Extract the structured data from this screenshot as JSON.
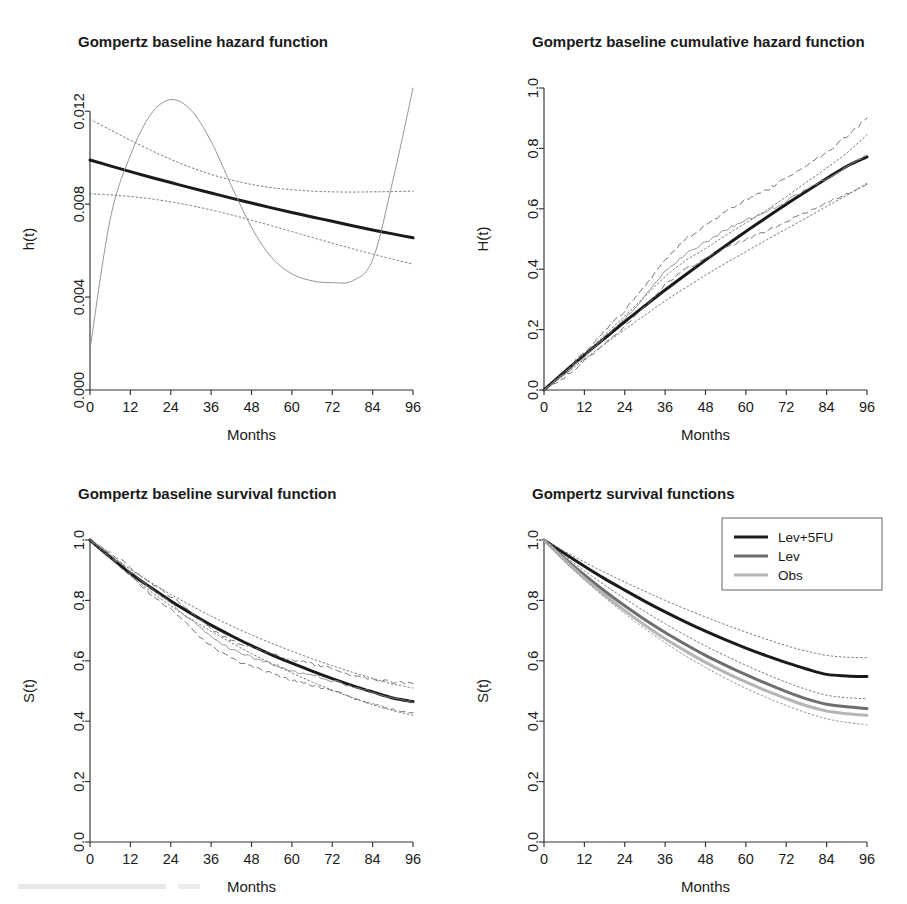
{
  "figure": {
    "width": 907,
    "height": 904,
    "background": "#ffffff",
    "layout": "2x2 grid of R base-graphics panels"
  },
  "style": {
    "fitted_color": "#1a1a1a",
    "lev_color": "#6e6e6e",
    "obs_color": "#b5b5b5",
    "nonparametric_color": "#8a8a8a",
    "ci_color": "#707070",
    "axis_color": "#333333"
  },
  "panels": [
    {
      "id": "hazard",
      "title": "Gompertz baseline  hazard function",
      "xlabel": "Months",
      "ylabel": "h(t)"
    },
    {
      "id": "cumhazard",
      "title": "Gompertz baseline cumulative hazard function",
      "xlabel": "Months",
      "ylabel": "H(t)"
    },
    {
      "id": "survival",
      "title": "Gompertz baseline survival function",
      "xlabel": "Months",
      "ylabel": "S(t)"
    },
    {
      "id": "survgroups",
      "title": "Gompertz survival functions",
      "xlabel": "Months",
      "ylabel": "S(t)"
    }
  ],
  "chart_data": [
    {
      "id": "hazard",
      "type": "line",
      "title": "Gompertz baseline  hazard function",
      "xlabel": "Months",
      "ylabel": "h(t)",
      "xlim": [
        0,
        96
      ],
      "ylim": [
        0,
        0.013
      ],
      "xticks": [
        0,
        12,
        24,
        36,
        48,
        60,
        72,
        84,
        96
      ],
      "yticks": [
        0.0,
        0.004,
        0.008,
        0.012
      ],
      "ytick_labels": [
        "0.000",
        "0.004",
        "0.008",
        "0.012"
      ],
      "grid": false,
      "legend": null,
      "x": [
        0,
        6,
        12,
        18,
        24,
        30,
        36,
        42,
        48,
        54,
        60,
        66,
        72,
        78,
        84,
        90,
        96
      ],
      "series": [
        {
          "name": "Gompertz fitted baseline hazard",
          "style": "solid-thick",
          "color": "#1a1a1a",
          "values": [
            0.0099,
            0.00965,
            0.0094,
            0.00916,
            0.00893,
            0.0087,
            0.00848,
            0.00826,
            0.00805,
            0.00784,
            0.00764,
            0.00745,
            0.00726,
            0.00707,
            0.00689,
            0.00672,
            0.00655
          ]
        },
        {
          "name": "Upper 95% confidence band",
          "style": "dotted",
          "color": "#707070",
          "values": [
            0.01165,
            0.0112,
            0.01075,
            0.01032,
            0.00993,
            0.00958,
            0.00928,
            0.00904,
            0.00885,
            0.00871,
            0.00862,
            0.00856,
            0.00853,
            0.00852,
            0.00853,
            0.00854,
            0.00856
          ]
        },
        {
          "name": "Lower 95% confidence band",
          "style": "dotted",
          "color": "#707070",
          "values": [
            0.00845,
            0.0084,
            0.00833,
            0.00823,
            0.0081,
            0.00794,
            0.00775,
            0.00754,
            0.00731,
            0.00707,
            0.00682,
            0.00657,
            0.00632,
            0.00608,
            0.00585,
            0.00563,
            0.00542
          ]
        },
        {
          "name": "Smoothed non-parametric hazard",
          "style": "solid-thin",
          "color": "#8a8a8a",
          "values": [
            0.00175,
            0.00735,
            0.0101,
            0.01185,
            0.0125,
            0.01205,
            0.0107,
            0.0088,
            0.007,
            0.0057,
            0.005,
            0.0047,
            0.00462,
            0.0047,
            0.0056,
            0.009,
            0.013
          ]
        }
      ]
    },
    {
      "id": "cumhazard",
      "type": "line",
      "title": "Gompertz baseline cumulative hazard function",
      "xlabel": "Months",
      "ylabel": "H(t)",
      "xlim": [
        0,
        96
      ],
      "ylim": [
        0,
        1.0
      ],
      "xticks": [
        0,
        12,
        24,
        36,
        48,
        60,
        72,
        84,
        96
      ],
      "yticks": [
        0.0,
        0.2,
        0.4,
        0.6,
        0.8,
        1.0
      ],
      "ytick_labels": [
        "0.0",
        "0.2",
        "0.4",
        "0.6",
        "0.8",
        "1.0"
      ],
      "grid": false,
      "legend": null,
      "x": [
        0,
        6,
        12,
        18,
        24,
        30,
        36,
        42,
        48,
        54,
        60,
        66,
        72,
        78,
        84,
        90,
        96
      ],
      "series": [
        {
          "name": "Gompertz fitted cumulative hazard",
          "style": "solid-thick",
          "color": "#1a1a1a",
          "values": [
            0.0,
            0.059,
            0.116,
            0.171,
            0.226,
            0.279,
            0.331,
            0.381,
            0.43,
            0.478,
            0.525,
            0.57,
            0.615,
            0.658,
            0.7,
            0.741,
            0.772
          ]
        },
        {
          "name": "Nelson-Aalen estimate",
          "style": "solid-thin",
          "color": "#8a8a8a",
          "values": [
            0.0,
            0.05,
            0.11,
            0.175,
            0.235,
            0.31,
            0.39,
            0.45,
            0.49,
            0.53,
            0.565,
            0.59,
            0.625,
            0.665,
            0.7,
            0.74,
            0.775
          ]
        },
        {
          "name": "Upper 95% band (Nelson-Aalen)",
          "style": "dashed",
          "color": "#707070",
          "values": [
            0.0,
            0.058,
            0.125,
            0.196,
            0.262,
            0.345,
            0.432,
            0.5,
            0.545,
            0.59,
            0.63,
            0.66,
            0.7,
            0.745,
            0.788,
            0.84,
            0.9
          ]
        },
        {
          "name": "Lower 95% band (Nelson-Aalen)",
          "style": "dashed",
          "color": "#707070",
          "values": [
            0.0,
            0.042,
            0.096,
            0.154,
            0.208,
            0.275,
            0.348,
            0.4,
            0.435,
            0.47,
            0.5,
            0.525,
            0.555,
            0.59,
            0.62,
            0.65,
            0.682
          ]
        },
        {
          "name": "Upper 95% band (model)",
          "style": "dotted",
          "color": "#707070",
          "values": [
            0.0,
            0.058,
            0.12,
            0.182,
            0.245,
            0.31,
            0.375,
            0.428,
            0.468,
            0.512,
            0.553,
            0.595,
            0.64,
            0.688,
            0.735,
            0.785,
            0.845
          ]
        },
        {
          "name": "Lower 95% band (model)",
          "style": "dotted",
          "color": "#707070",
          "values": [
            0.0,
            0.05,
            0.102,
            0.152,
            0.2,
            0.248,
            0.295,
            0.338,
            0.38,
            0.42,
            0.458,
            0.496,
            0.533,
            0.57,
            0.608,
            0.645,
            0.685
          ]
        }
      ]
    },
    {
      "id": "survival",
      "type": "line",
      "title": "Gompertz baseline survival function",
      "xlabel": "Months",
      "ylabel": "S(t)",
      "xlim": [
        0,
        96
      ],
      "ylim": [
        0,
        1.0
      ],
      "xticks": [
        0,
        12,
        24,
        36,
        48,
        60,
        72,
        84,
        96
      ],
      "yticks": [
        0.0,
        0.2,
        0.4,
        0.6,
        0.8,
        1.0
      ],
      "ytick_labels": [
        "0.0",
        "0.2",
        "0.4",
        "0.6",
        "0.8",
        "1.0"
      ],
      "grid": false,
      "legend": null,
      "x": [
        0,
        6,
        12,
        18,
        24,
        30,
        36,
        42,
        48,
        54,
        60,
        66,
        72,
        78,
        84,
        90,
        96
      ],
      "series": [
        {
          "name": "Gompertz fitted baseline survival",
          "style": "solid-thick",
          "color": "#1a1a1a",
          "values": [
            1.0,
            0.943,
            0.89,
            0.843,
            0.798,
            0.757,
            0.718,
            0.683,
            0.65,
            0.62,
            0.592,
            0.566,
            0.541,
            0.518,
            0.497,
            0.477,
            0.465
          ]
        },
        {
          "name": "Kaplan-Meier estimate",
          "style": "solid-thin",
          "color": "#8a8a8a",
          "values": [
            1.0,
            0.951,
            0.896,
            0.84,
            0.791,
            0.734,
            0.677,
            0.638,
            0.613,
            0.589,
            0.568,
            0.554,
            0.535,
            0.514,
            0.497,
            0.477,
            0.461
          ]
        },
        {
          "name": "Upper 95% band (KM)",
          "style": "dashed",
          "color": "#707070",
          "values": [
            1.0,
            0.958,
            0.909,
            0.858,
            0.813,
            0.761,
            0.706,
            0.668,
            0.645,
            0.622,
            0.602,
            0.59,
            0.573,
            0.553,
            0.54,
            0.53,
            0.525
          ]
        },
        {
          "name": "Lower 95% band (KM)",
          "style": "dashed",
          "color": "#707070",
          "values": [
            1.0,
            0.944,
            0.883,
            0.822,
            0.769,
            0.708,
            0.648,
            0.608,
            0.582,
            0.558,
            0.535,
            0.52,
            0.5,
            0.478,
            0.458,
            0.44,
            0.428
          ]
        },
        {
          "name": "Upper 95% band (model)",
          "style": "dotted",
          "color": "#707070",
          "values": [
            1.0,
            0.95,
            0.903,
            0.86,
            0.82,
            0.783,
            0.748,
            0.716,
            0.686,
            0.658,
            0.632,
            0.607,
            0.584,
            0.562,
            0.542,
            0.523,
            0.51
          ]
        },
        {
          "name": "Lower 95% band (model)",
          "style": "dotted",
          "color": "#707070",
          "values": [
            1.0,
            0.94,
            0.882,
            0.83,
            0.782,
            0.738,
            0.698,
            0.66,
            0.624,
            0.591,
            0.56,
            0.53,
            0.503,
            0.478,
            0.455,
            0.435,
            0.42
          ]
        }
      ]
    },
    {
      "id": "survgroups",
      "type": "line",
      "title": "Gompertz survival functions",
      "xlabel": "Months",
      "ylabel": "S(t)",
      "xlim": [
        0,
        96
      ],
      "ylim": [
        0,
        1.0
      ],
      "xticks": [
        0,
        12,
        24,
        36,
        48,
        60,
        72,
        84,
        96
      ],
      "yticks": [
        0.0,
        0.2,
        0.4,
        0.6,
        0.8,
        1.0
      ],
      "ytick_labels": [
        "0.0",
        "0.2",
        "0.4",
        "0.6",
        "0.8",
        "1.0"
      ],
      "grid": false,
      "legend": {
        "position": "top-right",
        "boxed": true,
        "entries": [
          {
            "label": "Lev+5FU",
            "color": "#1a1a1a",
            "style": "solid-thick"
          },
          {
            "label": "Lev",
            "color": "#6e6e6e",
            "style": "solid-thick"
          },
          {
            "label": "Obs",
            "color": "#b5b5b5",
            "style": "solid-thick"
          }
        ]
      },
      "x": [
        0,
        6,
        12,
        18,
        24,
        30,
        36,
        42,
        48,
        54,
        60,
        66,
        72,
        78,
        84,
        90,
        96
      ],
      "series": [
        {
          "name": "Lev+5FU",
          "style": "solid-thick",
          "color": "#1a1a1a",
          "values": [
            1.0,
            0.956,
            0.913,
            0.872,
            0.834,
            0.797,
            0.762,
            0.729,
            0.698,
            0.669,
            0.642,
            0.617,
            0.594,
            0.573,
            0.555,
            0.55,
            0.548
          ]
        },
        {
          "name": "Lev",
          "style": "solid-thick",
          "color": "#6e6e6e",
          "values": [
            1.0,
            0.94,
            0.884,
            0.831,
            0.782,
            0.736,
            0.694,
            0.655,
            0.618,
            0.585,
            0.554,
            0.525,
            0.498,
            0.474,
            0.456,
            0.448,
            0.442
          ]
        },
        {
          "name": "Obs",
          "style": "solid-thick",
          "color": "#b5b5b5",
          "values": [
            1.0,
            0.935,
            0.874,
            0.818,
            0.766,
            0.718,
            0.673,
            0.633,
            0.595,
            0.561,
            0.53,
            0.501,
            0.475,
            0.451,
            0.434,
            0.425,
            0.42
          ]
        },
        {
          "name": "Lev+5FU upper 95%",
          "style": "dotted",
          "color": "#707070",
          "values": [
            1.0,
            0.963,
            0.927,
            0.893,
            0.861,
            0.83,
            0.8,
            0.772,
            0.745,
            0.719,
            0.695,
            0.672,
            0.65,
            0.632,
            0.618,
            0.612,
            0.61
          ]
        },
        {
          "name": "Lev+5FU lower 95%",
          "style": "dotted",
          "color": "#707070",
          "values": [
            1.0,
            0.948,
            0.898,
            0.851,
            0.806,
            0.763,
            0.723,
            0.685,
            0.649,
            0.616,
            0.585,
            0.556,
            0.529,
            0.505,
            0.486,
            0.478,
            0.474
          ]
        },
        {
          "name": "Lev lower 95%",
          "style": "dotted",
          "color": "#8a8a8a",
          "values": [
            1.0,
            0.93,
            0.868,
            0.81,
            0.756,
            0.706,
            0.66,
            0.617,
            0.578,
            0.542,
            0.509,
            0.479,
            0.452,
            0.428,
            0.408,
            0.396,
            0.388
          ]
        }
      ]
    }
  ]
}
